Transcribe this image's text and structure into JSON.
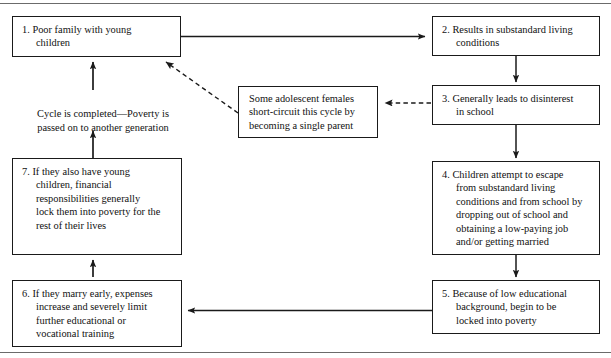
{
  "figure": {
    "line_color": "#1a1a1a",
    "rule_color": "#6b6b6b",
    "background": "#ffffff"
  },
  "rules": {
    "top": "horizontal-rule-top",
    "bottom": "horizontal-rule-bottom"
  },
  "nodes": [
    {
      "id": "node-1",
      "number": "1.",
      "text": "1.  Poor family with young\n     children"
    },
    {
      "id": "node-2",
      "number": "2.",
      "text": "2.  Results in substandard living\n     conditions"
    },
    {
      "id": "node-3",
      "number": "3.",
      "text": "3.  Generally leads to disinterest\n     in school"
    },
    {
      "id": "node-4",
      "number": "4.",
      "text": "4.  Children attempt to escape\n     from substandard living\n     conditions and from school by\n     dropping out of school and\n     obtaining a low-paying job\n     and/or getting married"
    },
    {
      "id": "node-5",
      "number": "5.",
      "text": "5.  Because of low educational\n     background, begin to be\n     locked into poverty"
    },
    {
      "id": "node-6",
      "number": "6.",
      "text": "6.  If they marry early, expenses\n     increase and severely limit\n     further educational or\n     vocational training"
    },
    {
      "id": "node-7",
      "number": "7.",
      "text": "7.  If they also have young\n     children, financial\n     responsibilities generally\n     lock them into poverty for the\n     rest of their lives"
    },
    {
      "id": "node-shortcircuit",
      "number": "",
      "text": "Some adolescent females\nshort-circuit this cycle by\nbecoming a single parent"
    }
  ],
  "caption": {
    "cycle_completed": "Cycle is completed—Poverty is\npassed on to another generation"
  },
  "connectors": [
    {
      "id": "arrow-1-to-2",
      "style": "solid",
      "direction": "right"
    },
    {
      "id": "arrow-2-to-3",
      "style": "solid",
      "direction": "down"
    },
    {
      "id": "arrow-3-to-4",
      "style": "solid",
      "direction": "down"
    },
    {
      "id": "arrow-4-to-5",
      "style": "solid",
      "direction": "down"
    },
    {
      "id": "arrow-5-to-6",
      "style": "solid",
      "direction": "left"
    },
    {
      "id": "arrow-6-to-7",
      "style": "solid",
      "direction": "up"
    },
    {
      "id": "arrow-7-to-1",
      "style": "solid",
      "direction": "up"
    },
    {
      "id": "arrow-3-to-shortcircuit",
      "style": "dashed",
      "direction": "left"
    },
    {
      "id": "arrow-shortcircuit-to-1",
      "style": "dashed",
      "direction": "up-left"
    }
  ]
}
